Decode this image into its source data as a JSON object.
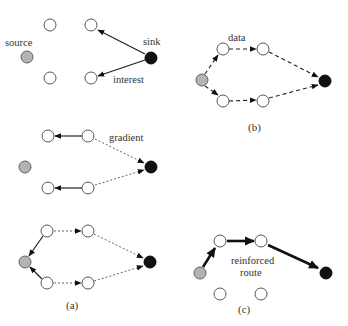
{
  "diagram": {
    "colors": {
      "empty_node": "#ffffff",
      "source_node": "#b3b3b3",
      "sink_node": "#111111",
      "edge": "#222222"
    },
    "panels": [
      {
        "id": "interest-propagation",
        "labels": {
          "source": "source",
          "sink": "sink",
          "edge": "interest"
        },
        "edge_style": "solid"
      },
      {
        "id": "gradient-setup",
        "labels": {
          "edge": "gradient"
        },
        "edge_style": "dotted"
      },
      {
        "id": "panel-a",
        "caption": "(a)",
        "edge_style": "dotted"
      },
      {
        "id": "panel-b",
        "caption": "(b)",
        "labels": {
          "edge": "data"
        },
        "edge_style": "dashed"
      },
      {
        "id": "panel-c",
        "caption": "(c)",
        "labels": {
          "edge_line1": "reinforced",
          "edge_line2": "route"
        },
        "edge_style": "bold"
      }
    ]
  }
}
